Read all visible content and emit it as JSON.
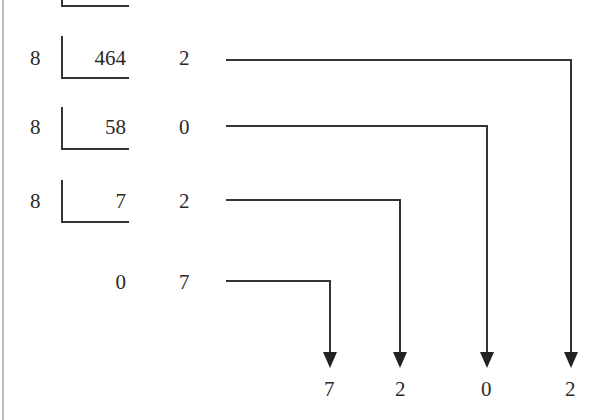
{
  "divisor": "8",
  "rows": [
    {
      "divisor": "8",
      "dividend": "464",
      "remainder": "2"
    },
    {
      "divisor": "8",
      "dividend": "58",
      "remainder": "0"
    },
    {
      "divisor": "8",
      "dividend": "7",
      "remainder": "2"
    },
    {
      "divisor": "",
      "dividend": "0",
      "remainder": "7"
    }
  ],
  "result_digits": [
    "7",
    "2",
    "0",
    "2"
  ],
  "colors": {
    "line": "#333333",
    "text": "#2a2a2a",
    "border": "#bdbdbd"
  }
}
